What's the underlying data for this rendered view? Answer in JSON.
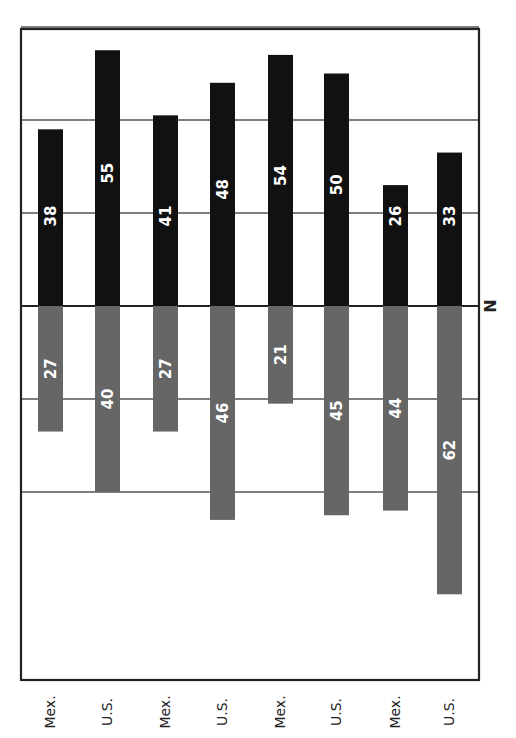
{
  "chart_data": {
    "type": "bar",
    "orientation": "diverging-vertical (page rotated 90°)",
    "title": "",
    "xlabel": "",
    "ylabel": "N",
    "categories": [
      "Mex.",
      "U.S.",
      "Mex.",
      "U.S.",
      "Mex.",
      "U.S.",
      "Mex.",
      "U.S."
    ],
    "series": [
      {
        "name": "upper (black)",
        "color": "#111111",
        "values": [
          38,
          55,
          41,
          48,
          54,
          50,
          26,
          33
        ]
      },
      {
        "name": "lower (gray)",
        "color": "#666666",
        "values": [
          27,
          40,
          27,
          46,
          21,
          45,
          44,
          62
        ]
      }
    ],
    "gridlines": [
      -40,
      -20,
      0,
      20,
      40,
      60
    ],
    "ylim": [
      -60,
      80
    ],
    "grid": true,
    "legend": "none"
  },
  "axis": {
    "n_label": "N"
  }
}
